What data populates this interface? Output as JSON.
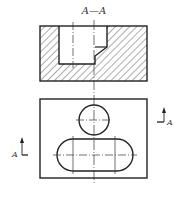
{
  "section_view": {
    "title": "A—A",
    "hatch": "diagonal-45",
    "outer": {
      "x": 40,
      "y": 26,
      "w": 107,
      "h": 55
    },
    "cavity": {
      "left": 59,
      "right": 107,
      "step_x": 95,
      "notch_y": 47,
      "notch_bottom_y": 56,
      "bottom_y": 64
    }
  },
  "top_view": {
    "outer": {
      "x": 40,
      "y": 99,
      "w": 107,
      "h": 79
    },
    "circle": {
      "cx": 94,
      "cy": 120,
      "r": 15
    },
    "slot": {
      "x1": 57,
      "x2": 133,
      "cy": 155,
      "r": 16
    },
    "slot_centerlines_x": [
      73,
      115
    ]
  },
  "section_markers": {
    "left": {
      "label": "A"
    },
    "right": {
      "label": "A"
    }
  },
  "centerline_x": 94,
  "colors": {
    "line": "#222222",
    "hatch": "#444444",
    "bg": "#ffffff"
  }
}
